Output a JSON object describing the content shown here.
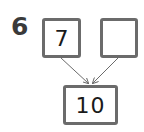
{
  "question_number": "6",
  "number_bond": {
    "part_a": "7",
    "part_b": "",
    "whole": "10"
  },
  "colors": {
    "box_border": "#6b6b6b",
    "text": "#1a1a1a",
    "arrow": "#6b6b6b"
  }
}
